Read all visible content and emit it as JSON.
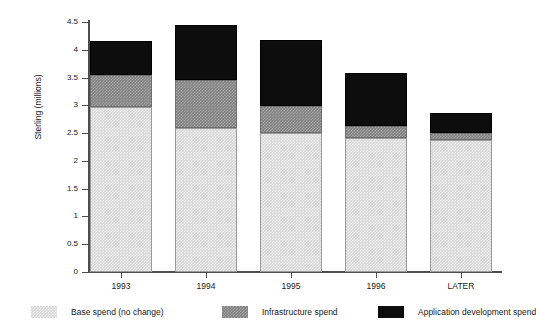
{
  "chart_data": {
    "type": "bar",
    "subtype": "stacked-bar",
    "title": "",
    "xlabel": "",
    "ylabel": "Sterling (millions)",
    "categories": [
      "1993",
      "1994",
      "1995",
      "1996",
      "LATER"
    ],
    "series": [
      {
        "name": "Base spend (no change)",
        "color": "#d8d8d8",
        "values": [
          2.97,
          2.59,
          2.5,
          2.41,
          2.38
        ]
      },
      {
        "name": "Infrastructure spend",
        "color": "#838383",
        "values": [
          0.58,
          0.87,
          0.49,
          0.22,
          0.12
        ]
      },
      {
        "name": "Application development spend",
        "color": "#0d0d0d",
        "values": [
          0.61,
          0.99,
          1.19,
          0.95,
          0.36
        ]
      }
    ],
    "totals": [
      4.16,
      4.45,
      4.18,
      3.58,
      2.86
    ],
    "ylim": [
      0,
      4.5
    ],
    "ytick_values": [
      0,
      0.5,
      1,
      1.5,
      2,
      2.5,
      3,
      3.5,
      4,
      4.5
    ],
    "ytick_labels": [
      "0",
      "0.5",
      "1",
      "1.5",
      "2",
      "2.5",
      "3",
      "3.5",
      "4",
      "4.5"
    ],
    "grid": false,
    "legend_position": "bottom"
  },
  "legend": {
    "items": [
      {
        "label": "Base spend (no change)"
      },
      {
        "label": "Infrastructure spend"
      },
      {
        "label": "Application development spend"
      }
    ]
  }
}
